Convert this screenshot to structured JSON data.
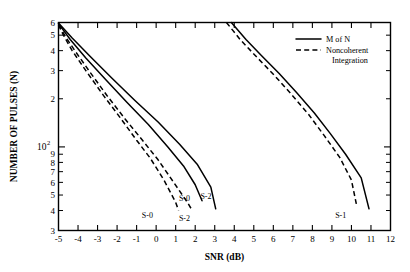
{
  "chart_data": {
    "type": "line",
    "title": "",
    "xlabel": "SNR (dB)",
    "ylabel": "NUMBER OF PULSES (N)",
    "xlim": [
      -5,
      12
    ],
    "ylim": [
      30,
      600
    ],
    "yscale": "log",
    "xscale": "linear",
    "grid": false,
    "legend_position": "top-right",
    "x_ticks": [
      -5,
      -4,
      -3,
      -2,
      -1,
      0,
      1,
      2,
      3,
      4,
      5,
      6,
      7,
      8,
      9,
      10,
      11,
      12
    ],
    "x_tick_labels": [
      "-5",
      "-4",
      "-3",
      "-2",
      "-1",
      "0",
      "1",
      "2",
      "3",
      "4",
      "5",
      "6",
      "7",
      "8",
      "9",
      "10",
      "11",
      "12"
    ],
    "y_ticks": [
      30,
      40,
      50,
      60,
      70,
      80,
      90,
      100,
      200,
      300,
      400,
      500,
      600
    ],
    "y_tick_labels": [
      "3",
      "4",
      "5",
      "6",
      "7",
      "8",
      "9",
      "10^2",
      "2",
      "3",
      "4",
      "5",
      "6"
    ],
    "y_decade_label": "10",
    "y_decade_exponent": "2",
    "series": [
      {
        "name": "S-0 Noncoherent Integration",
        "style": "dashed",
        "label": "S-0",
        "label_x": -0.45,
        "label_y": 36,
        "points": [
          [
            -5,
            580
          ],
          [
            -4.75,
            500
          ],
          [
            -4.3,
            400
          ],
          [
            -3.6,
            300
          ],
          [
            -2.7,
            210
          ],
          [
            -1.8,
            150
          ],
          [
            -1.0,
            110
          ],
          [
            -0.3,
            85
          ],
          [
            0.4,
            62
          ],
          [
            1.0,
            45
          ],
          [
            1.15,
            40
          ]
        ]
      },
      {
        "name": "S-2 Noncoherent Integration",
        "style": "dashed",
        "label": "S-2",
        "label_x": 1.45,
        "label_y": 34.5,
        "points": [
          [
            -5,
            580
          ],
          [
            -4.6,
            480
          ],
          [
            -4.1,
            390
          ],
          [
            -3.4,
            295
          ],
          [
            -2.5,
            208
          ],
          [
            -1.6,
            150
          ],
          [
            -0.7,
            110
          ],
          [
            0.1,
            83
          ],
          [
            0.9,
            60
          ],
          [
            1.6,
            45
          ],
          [
            1.85,
            40
          ]
        ]
      },
      {
        "name": "S-0 M of N",
        "style": "solid",
        "label": "S-0",
        "label_x": 1.45,
        "label_y": 46,
        "points": [
          [
            -5,
            590
          ],
          [
            -4.4,
            470
          ],
          [
            -3.6,
            360
          ],
          [
            -2.6,
            265
          ],
          [
            -1.5,
            190
          ],
          [
            -0.4,
            138
          ],
          [
            0.6,
            100
          ],
          [
            1.4,
            76
          ],
          [
            2.0,
            58
          ],
          [
            2.35,
            46
          ]
        ]
      },
      {
        "name": "S-2 M of N",
        "style": "solid",
        "label": "S-2",
        "label_x": 2.55,
        "label_y": 47,
        "points": [
          [
            -5,
            595
          ],
          [
            -4.3,
            480
          ],
          [
            -3.4,
            370
          ],
          [
            -2.3,
            272
          ],
          [
            -1.1,
            196
          ],
          [
            0.1,
            143
          ],
          [
            1.2,
            104
          ],
          [
            2.1,
            78
          ],
          [
            2.8,
            56
          ],
          [
            3.05,
            41
          ]
        ]
      },
      {
        "name": "S-1 Noncoherent Integration",
        "style": "dashed",
        "label": "S-1",
        "label_x": 9.45,
        "label_y": 36,
        "points": [
          [
            3.6,
            600
          ],
          [
            4.3,
            470
          ],
          [
            5.1,
            370
          ],
          [
            6.0,
            285
          ],
          [
            6.9,
            215
          ],
          [
            7.8,
            160
          ],
          [
            8.6,
            118
          ],
          [
            9.4,
            86
          ],
          [
            10.0,
            62
          ],
          [
            10.25,
            44
          ]
        ]
      },
      {
        "name": "S-1 M of N",
        "style": "solid",
        "label": "",
        "label_x": null,
        "label_y": null,
        "points": [
          [
            3.85,
            600
          ],
          [
            4.6,
            470
          ],
          [
            5.4,
            372
          ],
          [
            6.3,
            288
          ],
          [
            7.2,
            218
          ],
          [
            8.1,
            163
          ],
          [
            8.9,
            122
          ],
          [
            9.7,
            90
          ],
          [
            10.5,
            64
          ],
          [
            10.9,
            41
          ]
        ]
      }
    ],
    "legend": [
      {
        "label": "M of N",
        "style": "solid"
      },
      {
        "label": "Noncoherent Integration",
        "style": "dashed",
        "label_line_1": "Noncoherent",
        "label_line_2": "Integration"
      }
    ],
    "annotations": [
      "S-0",
      "S-2",
      "S-0",
      "S-2",
      "S-1"
    ]
  }
}
